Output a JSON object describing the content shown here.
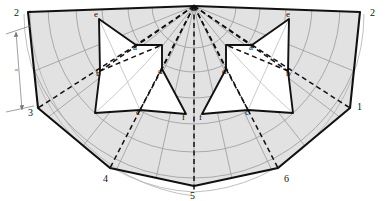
{
  "diagram": {
    "type": "geometric-construction",
    "colors": {
      "background": "#ffffff",
      "shade_fill": "#e2e2e2",
      "white_fill": "#ffffff",
      "outline": "#111111",
      "construction_gray": "#9a9a9a",
      "dashed": "#111111"
    },
    "apex": {
      "x": 194,
      "y": 6
    },
    "numbered_points": [
      {
        "label": "2",
        "x": 28,
        "y": 12,
        "tx": 14,
        "ty": 16
      },
      {
        "label": "2",
        "x": 360,
        "y": 12,
        "tx": 370,
        "ty": 16
      },
      {
        "label": "3",
        "x": 38,
        "y": 108,
        "tx": 28,
        "ty": 116
      },
      {
        "label": "1",
        "x": 350,
        "y": 108,
        "tx": 357,
        "ty": 110
      },
      {
        "label": "4",
        "x": 110,
        "y": 168,
        "tx": 103,
        "ty": 182
      },
      {
        "label": "5",
        "x": 194,
        "y": 186,
        "tx": 190,
        "ty": 199
      },
      {
        "label": "6",
        "x": 278,
        "y": 168,
        "tx": 284,
        "ty": 182
      }
    ],
    "letter_points_left": [
      {
        "label": "a",
        "x": 136,
        "y": 45,
        "tx": 133,
        "ty": 50
      },
      {
        "label": "b",
        "x": 100,
        "y": 71,
        "tx": 96,
        "ty": 76
      },
      {
        "label": "c",
        "x": 140,
        "y": 110,
        "tx": 136,
        "ty": 115
      },
      {
        "label": "d",
        "x": 162,
        "y": 69,
        "tx": 158,
        "ty": 74
      },
      {
        "label": "e",
        "x": 99,
        "y": 19,
        "tx": 94,
        "ty": 17
      },
      {
        "label": "f",
        "x": 186,
        "y": 114,
        "tx": 182,
        "ty": 120
      }
    ],
    "letter_points_right": [
      {
        "label": "a",
        "x": 252,
        "y": 45,
        "tx": 249,
        "ty": 50
      },
      {
        "label": "b",
        "x": 288,
        "y": 71,
        "tx": 286,
        "ty": 76
      },
      {
        "label": "c",
        "x": 248,
        "y": 110,
        "tx": 245,
        "ty": 115
      },
      {
        "label": "d",
        "x": 226,
        "y": 69,
        "tx": 222,
        "ty": 74
      },
      {
        "label": "e",
        "x": 289,
        "y": 19,
        "tx": 286,
        "ty": 17
      },
      {
        "label": "f",
        "x": 202,
        "y": 114,
        "tx": 199,
        "ty": 120
      }
    ],
    "dimension": {
      "label": "x",
      "x": 18,
      "y": 70
    }
  }
}
